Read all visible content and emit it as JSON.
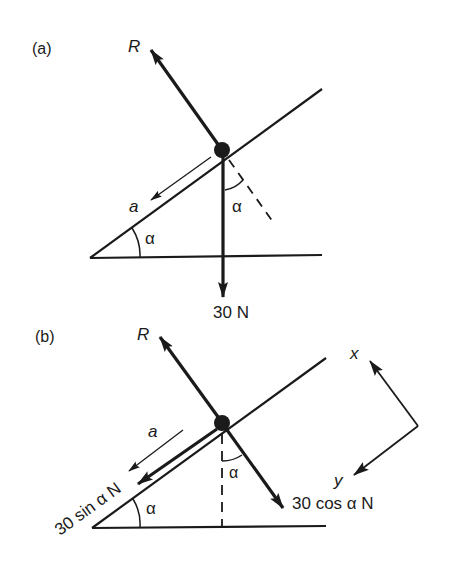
{
  "figure": {
    "panel_a": {
      "label": "(a)",
      "reaction_label": "R",
      "acceleration_label": "a",
      "incline_angle_label": "α",
      "weight_angle_label": "α",
      "weight_label": "30 N"
    },
    "panel_b": {
      "label": "(b)",
      "reaction_label": "R",
      "acceleration_label": "a",
      "incline_angle_label": "α",
      "weight_angle_label": "α",
      "parallel_component_label": "30 sin α N",
      "perpendicular_component_label": "30 cos α N",
      "axis_x_label": "x",
      "axis_y_label": "y"
    },
    "colors": {
      "ink": "#1a1a1a",
      "background": "#ffffff"
    }
  }
}
